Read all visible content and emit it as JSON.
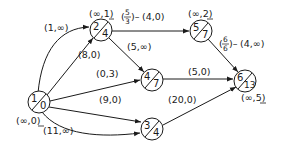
{
  "diagram": {
    "type": "network-flow",
    "nodes": [
      {
        "id": "1",
        "top": "1",
        "bottom": "0",
        "label": "(∞,0)",
        "label_underline": "0"
      },
      {
        "id": "2",
        "top": "2",
        "bottom": "4",
        "label": "(∞,1)",
        "label_underline": "1"
      },
      {
        "id": "5",
        "top": "5",
        "bottom": "7",
        "label": "(∞,2)",
        "label_underline": "2"
      },
      {
        "id": "4",
        "top": "4",
        "bottom": "7",
        "label": ""
      },
      {
        "id": "6",
        "top": "6",
        "bottom": "13",
        "label": "(∞,5)",
        "label_underline": "5"
      },
      {
        "id": "3",
        "top": "3",
        "bottom": "4",
        "label": ""
      }
    ],
    "edges": [
      {
        "from": "1",
        "to": "2",
        "label": "(1,∞)",
        "curved": true
      },
      {
        "from": "1",
        "to": "2",
        "label": "(8,0)",
        "curved": false
      },
      {
        "from": "1",
        "to": "4",
        "label": "(0,3)"
      },
      {
        "from": "1",
        "to": "3",
        "label": "(9,0)",
        "curved": false
      },
      {
        "from": "1",
        "to": "3",
        "label": "(11,∞)",
        "curved": true
      },
      {
        "from": "2",
        "to": "5",
        "label_fraction": {
          "num": "5",
          "den": "3"
        },
        "label": "(4,0)"
      },
      {
        "from": "2",
        "to": "4",
        "label": "(5,∞)"
      },
      {
        "from": "5",
        "to": "6",
        "label_fraction": {
          "num": "6",
          "den": "6"
        },
        "label": "(4,∞)"
      },
      {
        "from": "4",
        "to": "6",
        "label": "(5,0)"
      },
      {
        "from": "3",
        "to": "6",
        "label": "(20,0)"
      }
    ]
  }
}
